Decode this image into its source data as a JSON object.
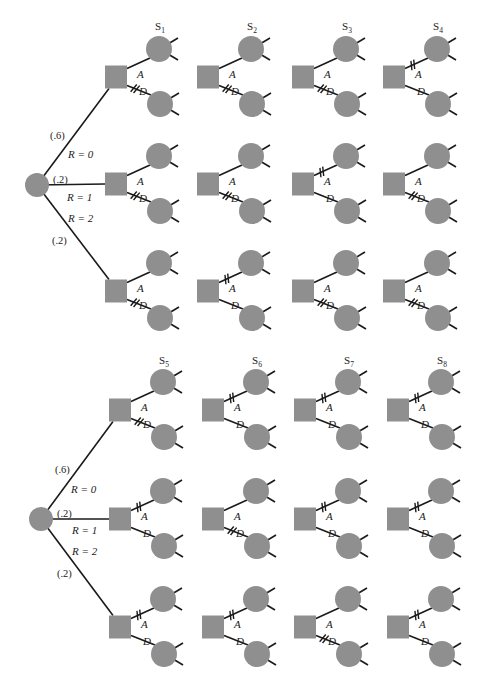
{
  "colors": {
    "background": "#ffffff",
    "node_fill": "#8f8f8f",
    "line": "#1a1a1a",
    "text": "#222222"
  },
  "geometry": {
    "square_w": 22,
    "square_h": 23,
    "circle_r": 13,
    "root_r": 12,
    "upper_dx": 54,
    "upper_dy": -28,
    "lower_dx": 55,
    "lower_dy": 27
  },
  "blocks": [
    {
      "id": "top",
      "root": {
        "cx": 37,
        "cy": 185
      },
      "root_edges": [
        {
          "probability": "(.6)",
          "outcome": "R = 0"
        },
        {
          "probability": "(.2)",
          "outcome": "R = 1"
        },
        {
          "probability": "(.2)",
          "outcome": "R = 2"
        }
      ],
      "label_positions": {
        "prob": [
          {
            "x": 50,
            "y": 139
          },
          {
            "x": 53,
            "y": 183
          },
          {
            "x": 52,
            "y": 244
          }
        ],
        "outcome": [
          {
            "x": 68,
            "y": 158
          },
          {
            "x": 67,
            "y": 201
          },
          {
            "x": 68,
            "y": 222
          }
        ]
      },
      "row_centers": [
        77,
        184,
        291
      ],
      "columns": [
        {
          "strategy": "S",
          "sub": "1",
          "square_x": 105,
          "pruned": [
            "D",
            "D",
            "D"
          ]
        },
        {
          "strategy": "S",
          "sub": "2",
          "square_x": 197,
          "pruned": [
            "D",
            "D",
            "A"
          ]
        },
        {
          "strategy": "S",
          "sub": "3",
          "square_x": 292,
          "pruned": [
            "D",
            "A",
            "D"
          ]
        },
        {
          "strategy": "S",
          "sub": "4",
          "square_x": 383,
          "pruned": [
            "A",
            "D",
            "D"
          ]
        }
      ],
      "strategy_label_y": 30
    },
    {
      "id": "bottom",
      "root": {
        "cx": 41,
        "cy": 519
      },
      "root_edges": [
        {
          "probability": "(.6)",
          "outcome": "R = 0"
        },
        {
          "probability": "(.2)",
          "outcome": "R = 1"
        },
        {
          "probability": "(.2)",
          "outcome": "R = 2"
        }
      ],
      "label_positions": {
        "prob": [
          {
            "x": 55,
            "y": 473
          },
          {
            "x": 57,
            "y": 517
          },
          {
            "x": 57,
            "y": 577
          }
        ],
        "outcome": [
          {
            "x": 71,
            "y": 493
          },
          {
            "x": 72,
            "y": 534
          },
          {
            "x": 72,
            "y": 555
          }
        ]
      },
      "row_centers": [
        410,
        519,
        627
      ],
      "columns": [
        {
          "strategy": "S",
          "sub": "5",
          "square_x": 109,
          "pruned": [
            "D",
            "A",
            "A"
          ]
        },
        {
          "strategy": "S",
          "sub": "6",
          "square_x": 202,
          "pruned": [
            "A",
            "D",
            "A"
          ]
        },
        {
          "strategy": "S",
          "sub": "7",
          "square_x": 294,
          "pruned": [
            "A",
            "A",
            "D"
          ]
        },
        {
          "strategy": "S",
          "sub": "8",
          "square_x": 387,
          "pruned": [
            "A",
            "A",
            "A"
          ]
        }
      ],
      "strategy_label_y": 364
    }
  ],
  "branch_labels": {
    "upper": "A",
    "lower": "D"
  },
  "icons": {
    "decision-node": "gray-square",
    "chance-node": "gray-circle",
    "pruned-branch": "double-hash-mark"
  }
}
